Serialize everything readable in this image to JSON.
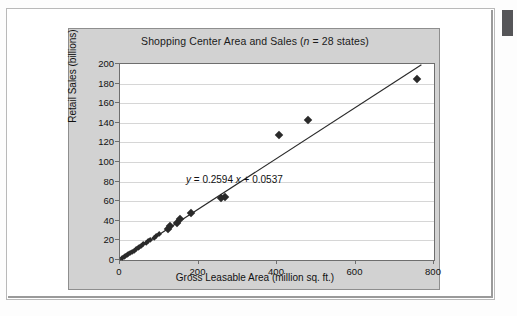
{
  "chart_data": {
    "type": "scatter",
    "title": "Shopping Center Area and Sales (n = 28 states)",
    "title_plain": "Shopping Center Area and Sales (",
    "title_italic_n": "n",
    "title_tail": " = 28 states)",
    "xlabel": "Gross Leasable Area (million sq. ft.)",
    "ylabel": "Retail Sales (billions)",
    "xlim": [
      0,
      800
    ],
    "ylim": [
      0,
      200
    ],
    "xticks": [
      "0",
      "200",
      "400",
      "600",
      "800"
    ],
    "xtick_values": [
      0,
      200,
      400,
      600,
      800
    ],
    "yticks": [
      "0",
      "20",
      "40",
      "60",
      "80",
      "100",
      "120",
      "140",
      "160",
      "180",
      "200"
    ],
    "ytick_values": [
      0,
      20,
      40,
      60,
      80,
      100,
      120,
      140,
      160,
      180,
      200
    ],
    "grid": "horizontal",
    "legend": "none",
    "annotation": "y = 0.2594 x + 0.0537",
    "annotation_parts": {
      "y": "y",
      "eq": " = 0.2594 ",
      "x": "x",
      "tail": " + 0.0537"
    },
    "trendline": {
      "type": "linear",
      "slope": 0.2594,
      "intercept": 0.0537,
      "x_start": 0,
      "x_end": 768
    },
    "points": [
      {
        "x": 6,
        "y": 2
      },
      {
        "x": 10,
        "y": 3
      },
      {
        "x": 14,
        "y": 4
      },
      {
        "x": 18,
        "y": 5
      },
      {
        "x": 22,
        "y": 6
      },
      {
        "x": 26,
        "y": 7
      },
      {
        "x": 31,
        "y": 8
      },
      {
        "x": 35,
        "y": 9
      },
      {
        "x": 40,
        "y": 11
      },
      {
        "x": 45,
        "y": 12
      },
      {
        "x": 50,
        "y": 13
      },
      {
        "x": 55,
        "y": 14
      },
      {
        "x": 60,
        "y": 16
      },
      {
        "x": 66,
        "y": 17
      },
      {
        "x": 72,
        "y": 19
      },
      {
        "x": 78,
        "y": 20
      },
      {
        "x": 86,
        "y": 22
      },
      {
        "x": 92,
        "y": 24
      },
      {
        "x": 100,
        "y": 26
      },
      {
        "x": 122,
        "y": 32
      },
      {
        "x": 128,
        "y": 35
      },
      {
        "x": 145,
        "y": 38
      },
      {
        "x": 152,
        "y": 42
      },
      {
        "x": 182,
        "y": 48
      },
      {
        "x": 258,
        "y": 63
      },
      {
        "x": 268,
        "y": 64
      },
      {
        "x": 405,
        "y": 128
      },
      {
        "x": 480,
        "y": 143
      },
      {
        "x": 757,
        "y": 185
      }
    ]
  },
  "colors": {
    "panel": "#d2d2d2",
    "plot_bg": "#ffffff",
    "grid": "#d6d6d6",
    "axis": "#6e6e6e",
    "marker": "#2a2a2a",
    "trendline": "#2a2a2a",
    "text": "#111111"
  }
}
